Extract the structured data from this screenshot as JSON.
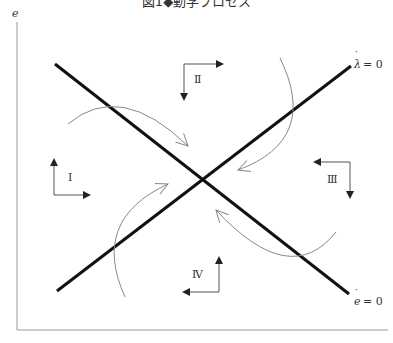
{
  "figure": {
    "title": "図1◆動学プロセス",
    "y_axis_label": "e",
    "line_labels": {
      "lambda_dot": "λ = 0",
      "e_dot": "e = 0"
    },
    "regions": [
      {
        "id": "I",
        "label": "Ⅰ",
        "arrows": [
          "up",
          "right"
        ]
      },
      {
        "id": "II",
        "label": "Ⅱ",
        "arrows": [
          "down",
          "right"
        ]
      },
      {
        "id": "III",
        "label": "Ⅲ",
        "arrows": [
          "left",
          "down"
        ]
      },
      {
        "id": "IV",
        "label": "Ⅳ",
        "arrows": [
          "up",
          "left"
        ]
      }
    ],
    "colors": {
      "main_lines": "#111111",
      "axes": "#999999",
      "curves": "#888888",
      "direction_arrows": "#555555"
    }
  }
}
